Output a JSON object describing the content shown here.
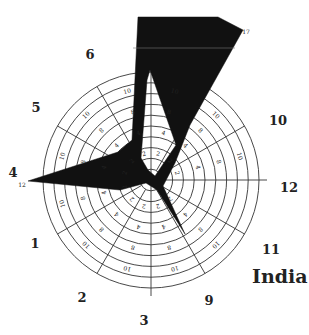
{
  "chart_data": {
    "type": "radar",
    "title": "India",
    "center": [
      151,
      180
    ],
    "outer_radius": 108,
    "rings": 10,
    "spokes_deg": [
      0,
      30,
      60,
      90,
      120,
      150,
      180,
      210,
      240,
      270,
      300,
      330
    ],
    "axis_labels": [
      {
        "label": "4",
        "x": 13,
        "y": 177
      },
      {
        "label": "5",
        "x": 36,
        "y": 112
      },
      {
        "label": "6",
        "x": 90,
        "y": 59
      },
      {
        "label": "10",
        "x": 278,
        "y": 125
      },
      {
        "label": "12",
        "x": 289,
        "y": 192
      },
      {
        "label": "11",
        "x": 271,
        "y": 254
      },
      {
        "label": "9",
        "x": 209,
        "y": 305
      },
      {
        "label": "3",
        "x": 144,
        "y": 325
      },
      {
        "label": "2",
        "x": 82,
        "y": 302
      },
      {
        "label": "1",
        "x": 35,
        "y": 248
      }
    ],
    "ring_tick_labels": [
      "1",
      "2",
      "3",
      "4",
      "5",
      "8",
      "10"
    ],
    "extra_tick_labels": [
      {
        "label": "12",
        "x": 22,
        "y": 187
      },
      {
        "label": "17",
        "x": 246,
        "y": 34
      }
    ],
    "series": [
      {
        "name": "India",
        "fill": "#111111",
        "values_by_axis": {
          "4": 12,
          "5": 3,
          "6": 10,
          "10": 17,
          "12": 1,
          "11": 4,
          "9": 1,
          "3": 1,
          "2": 1,
          "1": 2
        }
      }
    ],
    "polygon": [
      [
        138,
        17
      ],
      [
        218,
        17
      ],
      [
        243,
        30
      ],
      [
        175,
        168
      ],
      [
        165,
        185
      ],
      [
        183,
        232
      ],
      [
        158,
        186
      ],
      [
        151,
        180
      ],
      [
        142,
        188
      ],
      [
        128,
        183
      ],
      [
        30,
        181
      ],
      [
        125,
        158
      ],
      [
        150,
        95
      ],
      [
        153,
        70
      ],
      [
        175,
        168
      ]
    ],
    "polygon_outer": [
      [
        138,
        17
      ],
      [
        218,
        17
      ],
      [
        243,
        30
      ],
      [
        190,
        125
      ],
      [
        175,
        163
      ],
      [
        163,
        186
      ],
      [
        185,
        234
      ],
      [
        157,
        190
      ],
      [
        146,
        183
      ],
      [
        120,
        190
      ],
      [
        28,
        181
      ],
      [
        118,
        152
      ],
      [
        132,
        140
      ],
      [
        138,
        17
      ]
    ],
    "polygon_hole": [
      [
        150,
        70
      ],
      [
        176,
        145
      ],
      [
        155,
        176
      ],
      [
        148,
        170
      ],
      [
        141,
        158
      ],
      [
        147,
        80
      ]
    ]
  }
}
